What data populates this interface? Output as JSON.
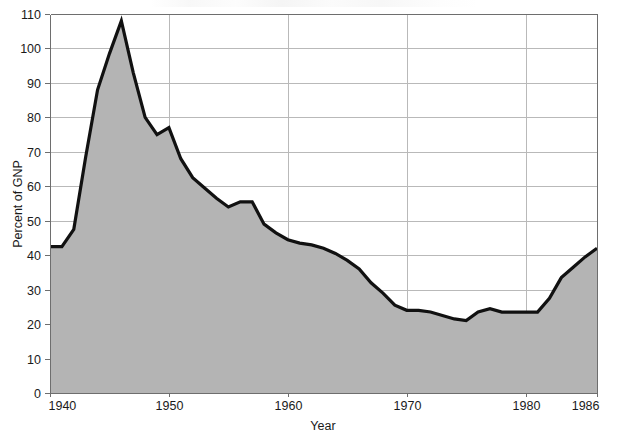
{
  "chart_data": {
    "type": "area",
    "title": "",
    "xlabel": "Year",
    "ylabel": "Percent of GNP",
    "xlim": [
      1940,
      1986
    ],
    "ylim": [
      0,
      110
    ],
    "grid": true,
    "legend": null,
    "xticks": [
      "1940",
      "1950",
      "1960",
      "1970",
      "1980",
      "1986"
    ],
    "xtick_values": [
      1940,
      1950,
      1960,
      1970,
      1980,
      1986
    ],
    "yticks": [
      "0",
      "10",
      "20",
      "30",
      "40",
      "50",
      "60",
      "70",
      "80",
      "90",
      "100",
      "110"
    ],
    "ytick_values": [
      0,
      10,
      20,
      30,
      40,
      50,
      60,
      70,
      80,
      90,
      100,
      110
    ],
    "series": [
      {
        "name": "Gross federal debt as percent of GNP",
        "fill_color": "#b4b4b4",
        "line_color": "#111111",
        "x": [
          1940,
          1941,
          1942,
          1943,
          1944,
          1945,
          1946,
          1947,
          1948,
          1949,
          1950,
          1951,
          1952,
          1953,
          1954,
          1955,
          1956,
          1957,
          1958,
          1959,
          1960,
          1961,
          1962,
          1963,
          1964,
          1965,
          1966,
          1967,
          1968,
          1969,
          1970,
          1971,
          1972,
          1973,
          1974,
          1975,
          1976,
          1977,
          1978,
          1979,
          1980,
          1981,
          1982,
          1983,
          1984,
          1985,
          1986
        ],
        "values": [
          42.5,
          42.5,
          47.5,
          68.5,
          88.0,
          98.5,
          108.0,
          93.0,
          80.0,
          75.0,
          77.0,
          68.0,
          62.5,
          59.5,
          56.5,
          54.0,
          55.5,
          55.5,
          49.0,
          46.5,
          44.5,
          43.5,
          43.0,
          42.0,
          40.5,
          38.5,
          36.0,
          32.0,
          29.0,
          25.5,
          24.0,
          24.0,
          23.5,
          22.5,
          21.5,
          21.0,
          23.5,
          24.5,
          23.5,
          23.5,
          23.5,
          23.5,
          27.5,
          33.5,
          36.5,
          39.5,
          42.0
        ]
      }
    ]
  }
}
